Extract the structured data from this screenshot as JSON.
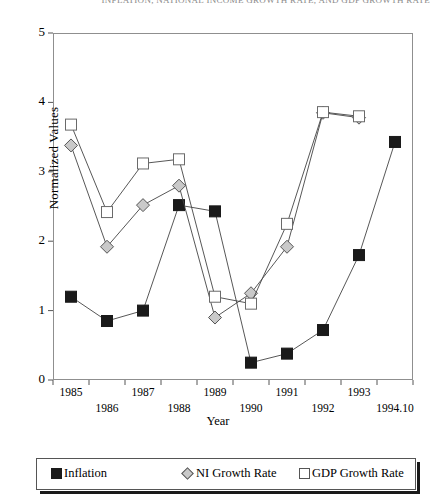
{
  "title_strip": "INFLATION, NATIONAL INCOME GROWTH RATE, AND GDP GROWTH RATE",
  "axes": {
    "ylabel": "Normalized Values",
    "xlabel": "Year",
    "yticks": [
      "0",
      "1",
      "2",
      "3",
      "4",
      "5"
    ],
    "xticks": [
      "1985",
      "1986",
      "1987",
      "1988",
      "1989",
      "1990",
      "1991",
      "1992",
      "1993",
      "1994.10"
    ]
  },
  "legend": {
    "items": [
      {
        "label": "Inflation",
        "marker": "filled-square",
        "color": "#1a1a1a"
      },
      {
        "label": "NI Growth Rate",
        "marker": "diamond",
        "color": "#c9c9c9"
      },
      {
        "label": "GDP Growth Rate",
        "marker": "open-square",
        "color": "#ffffff"
      }
    ]
  },
  "chart_data": {
    "type": "line",
    "title": "INFLATION, NATIONAL INCOME GROWTH RATE, AND GDP GROWTH RATE",
    "xlabel": "Year",
    "ylabel": "Normalized Values",
    "categories": [
      "1985",
      "1986",
      "1987",
      "1988",
      "1989",
      "1990",
      "1991",
      "1992",
      "1993",
      "1994.10"
    ],
    "ylim": [
      0,
      5
    ],
    "ytick_values": [
      0,
      1,
      2,
      3,
      4,
      5
    ],
    "grid": false,
    "legend_position": "bottom",
    "series": [
      {
        "name": "Inflation",
        "marker": "filled-square",
        "color": "#1a1a1a",
        "values": [
          1.2,
          0.85,
          1.0,
          2.52,
          2.43,
          0.25,
          0.38,
          0.72,
          1.8,
          3.43
        ]
      },
      {
        "name": "NI Growth Rate",
        "marker": "diamond",
        "color": "#c9c9c9",
        "values": [
          3.38,
          1.92,
          2.52,
          2.8,
          0.9,
          1.25,
          1.92,
          3.85,
          3.78,
          null
        ]
      },
      {
        "name": "GDP Growth Rate",
        "marker": "open-square",
        "color": "#ffffff",
        "values": [
          3.68,
          2.42,
          3.12,
          3.18,
          1.2,
          1.1,
          2.25,
          3.86,
          3.8,
          null
        ]
      }
    ]
  }
}
